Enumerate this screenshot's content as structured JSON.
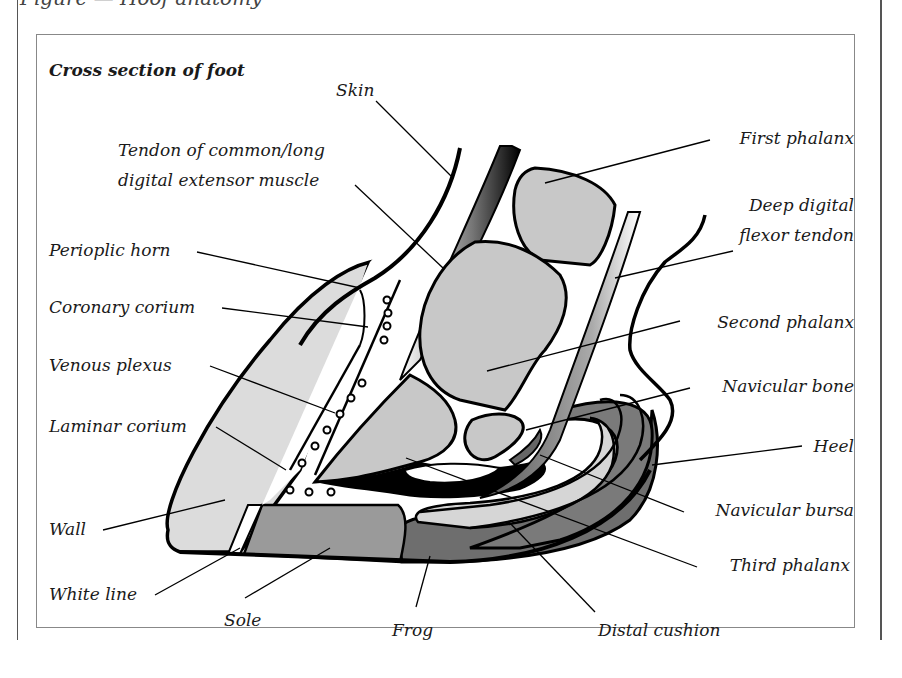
{
  "page": {
    "heading_fragment": "Figure — Hoof anatomy"
  },
  "figure": {
    "title": "Cross section of foot",
    "labels": {
      "skin": "Skin",
      "tendon_line1": "Tendon of common/long",
      "tendon_line2": "digital extensor muscle",
      "perioplic_horn": "Perioplic horn",
      "coronary_corium": "Coronary corium",
      "venous_plexus": "Venous plexus",
      "laminar_corium": "Laminar corium",
      "wall": "Wall",
      "white_line": "White line",
      "sole": "Sole",
      "frog": "Frog",
      "distal_cushion": "Distal cushion",
      "third_phalanx": "Third phalanx",
      "navicular_bursa": "Navicular bursa",
      "heel": "Heel",
      "navicular_bone": "Navicular bone",
      "second_phalanx": "Second phalanx",
      "deep_flexor_line1": "Deep digital",
      "deep_flexor_line2": "flexor tendon",
      "first_phalanx": "First phalanx"
    },
    "colors": {
      "outline": "#000000",
      "bone_fill": "#c8c8c8",
      "wall_fill": "#dcdcdc",
      "sole_fill": "#9a9a9a",
      "frog_fill": "#6e6e6e",
      "cushion_fill": "#d6d6d6",
      "background": "#ffffff"
    }
  }
}
